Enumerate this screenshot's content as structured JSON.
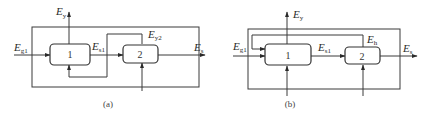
{
  "diagrams": {
    "a": {
      "caption": "(a)",
      "block1": "1",
      "block2": "2",
      "labels": {
        "input": {
          "main": "E",
          "sub": "g1"
        },
        "exhaust": {
          "main": "E",
          "sub": "y"
        },
        "intermediate": {
          "main": "E",
          "sub": "s1"
        },
        "recycle": {
          "main": "E",
          "sub": "y2"
        },
        "output": {
          "main": "E",
          "sub": "s"
        }
      }
    },
    "b": {
      "caption": "(b)",
      "block1": "1",
      "block2": "2",
      "labels": {
        "input": {
          "main": "E",
          "sub": "g1"
        },
        "exhaust": {
          "main": "E",
          "sub": "y"
        },
        "intermediate": {
          "main": "E",
          "sub": "s1"
        },
        "recycle": {
          "main": "E",
          "sub": "h"
        },
        "output": {
          "main": "E",
          "sub": "s"
        }
      }
    }
  },
  "colors": {
    "line": "#3a3a3a",
    "background": "#ffffff"
  }
}
